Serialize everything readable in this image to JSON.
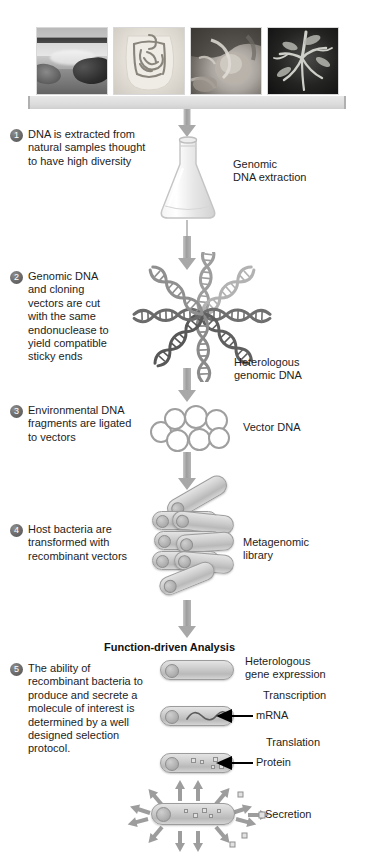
{
  "figure": {
    "background_color": "#ffffff",
    "accent_gray": "#a8a8a8",
    "badge_color": "#5a5a5a",
    "text_color": "#1d1d1d"
  },
  "photo_strip": {
    "name": "environmental-sample-photographs",
    "photos": [
      {
        "id": "photo-1",
        "subject": "coastal-shoreline-landscape",
        "alt": "Shoreline / hot spring landscape sample site"
      },
      {
        "id": "photo-2",
        "subject": "human-intestines",
        "alt": "Human gastrointestinal tract"
      },
      {
        "id": "photo-3",
        "subject": "animal-organ-dissection",
        "alt": "Animal organ / host tissue"
      },
      {
        "id": "photo-4",
        "subject": "plant-roots-soil",
        "alt": "Plant roots in soil"
      }
    ]
  },
  "steps": [
    {
      "number": "1",
      "text": "DNA is extracted from natural samples thought to have high diversity"
    },
    {
      "number": "2",
      "text": "Genomic DNA and cloning vectors are cut with the same endonuclease to yield compatible sticky ends"
    },
    {
      "number": "3",
      "text": "Environmental DNA fragments are ligated to vectors"
    },
    {
      "number": "4",
      "text": "Host bacteria are transformed with recombinant vectors"
    },
    {
      "number": "5",
      "text": "The ability of recombinant bacteria to produce and secrete a molecule of interest is determined by a well designed selection protocol."
    }
  ],
  "labels": {
    "genomic_dna_extraction": "Genomic\nDNA extraction",
    "heterologous_genomic_dna": "Heterologous\ngenomic DNA",
    "vector_dna": "Vector DNA",
    "metagenomic_library": "Metagenomic\nlibrary",
    "function_driven_analysis": "Function-driven Analysis",
    "heterologous_gene_expression": "Heterologous\ngene expression",
    "transcription": "Transcription",
    "mrna": "mRNA",
    "translation": "Translation",
    "protein": "Protein",
    "secretion": "Secretion"
  },
  "diagram_elements": {
    "dna_helices_count": 8,
    "plasmid_circles_count": 7,
    "library_rods_count": 8,
    "secretion_arrows_count": 14
  }
}
